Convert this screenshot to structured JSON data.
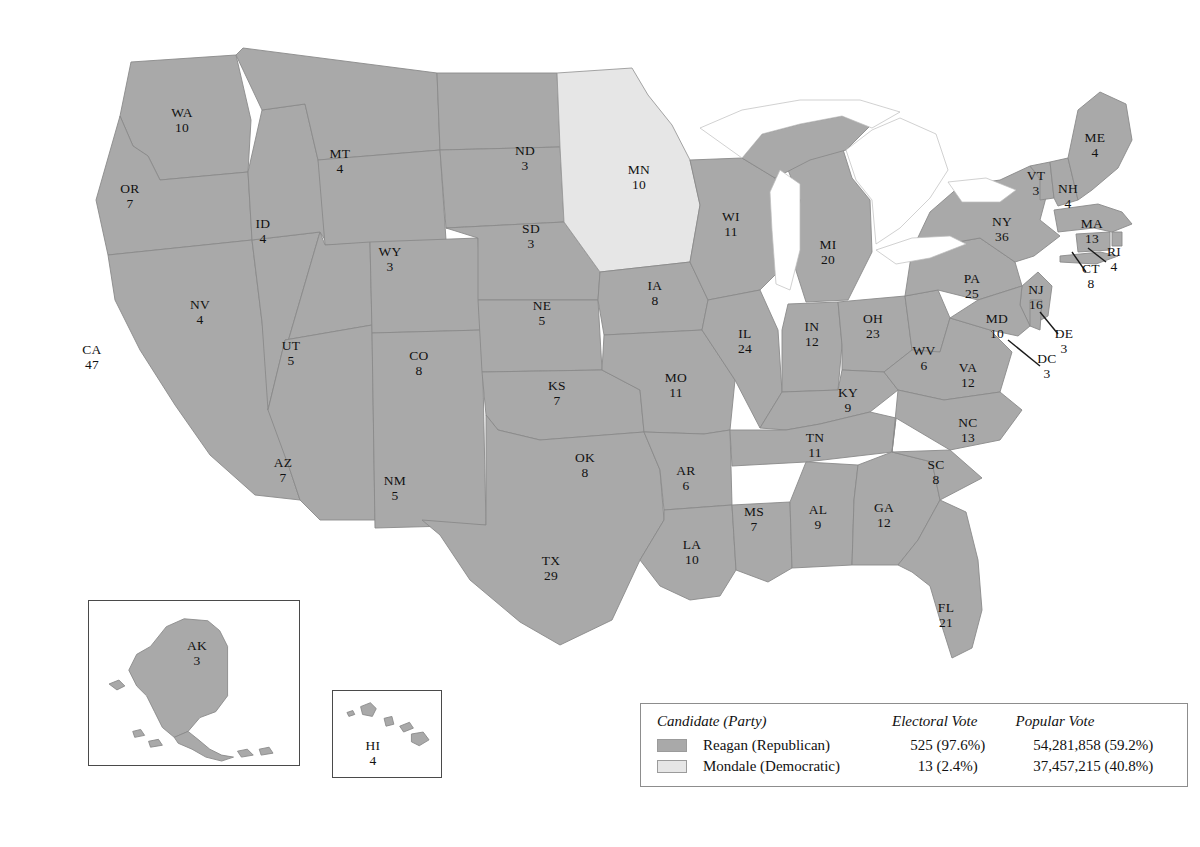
{
  "map": {
    "title": "1984 United States presidential election results by state",
    "colors": {
      "republican_fill": "#a9a9a9",
      "democratic_fill": "#e6e6e6",
      "state_border": "#8a8a8a",
      "label_text": "#111111",
      "inset_border": "#4a4a4a",
      "legend_border": "#8d8d8d"
    },
    "states": [
      {
        "code": "WA",
        "ev": "10",
        "party": "republican",
        "x": 182,
        "y": 120
      },
      {
        "code": "OR",
        "ev": "7",
        "party": "republican",
        "x": 130,
        "y": 196
      },
      {
        "code": "CA",
        "ev": "47",
        "party": "republican",
        "x": 92,
        "y": 357
      },
      {
        "code": "NV",
        "ev": "4",
        "party": "republican",
        "x": 200,
        "y": 312
      },
      {
        "code": "ID",
        "ev": "4",
        "party": "republican",
        "x": 263,
        "y": 231
      },
      {
        "code": "MT",
        "ev": "4",
        "party": "republican",
        "x": 340,
        "y": 161
      },
      {
        "code": "WY",
        "ev": "3",
        "party": "republican",
        "x": 390,
        "y": 259
      },
      {
        "code": "UT",
        "ev": "5",
        "party": "republican",
        "x": 291,
        "y": 353
      },
      {
        "code": "AZ",
        "ev": "7",
        "party": "republican",
        "x": 283,
        "y": 470
      },
      {
        "code": "CO",
        "ev": "8",
        "party": "republican",
        "x": 419,
        "y": 363
      },
      {
        "code": "NM",
        "ev": "5",
        "party": "republican",
        "x": 395,
        "y": 488
      },
      {
        "code": "ND",
        "ev": "3",
        "party": "republican",
        "x": 525,
        "y": 158
      },
      {
        "code": "SD",
        "ev": "3",
        "party": "republican",
        "x": 531,
        "y": 236
      },
      {
        "code": "NE",
        "ev": "5",
        "party": "republican",
        "x": 542,
        "y": 313
      },
      {
        "code": "KS",
        "ev": "7",
        "party": "republican",
        "x": 557,
        "y": 393
      },
      {
        "code": "OK",
        "ev": "8",
        "party": "republican",
        "x": 585,
        "y": 465
      },
      {
        "code": "TX",
        "ev": "29",
        "party": "republican",
        "x": 551,
        "y": 568
      },
      {
        "code": "MN",
        "ev": "10",
        "party": "democratic",
        "x": 639,
        "y": 177
      },
      {
        "code": "IA",
        "ev": "8",
        "party": "republican",
        "x": 655,
        "y": 293
      },
      {
        "code": "MO",
        "ev": "11",
        "party": "republican",
        "x": 676,
        "y": 385
      },
      {
        "code": "AR",
        "ev": "6",
        "party": "republican",
        "x": 686,
        "y": 478
      },
      {
        "code": "LA",
        "ev": "10",
        "party": "republican",
        "x": 692,
        "y": 552
      },
      {
        "code": "WI",
        "ev": "11",
        "party": "republican",
        "x": 731,
        "y": 224
      },
      {
        "code": "IL",
        "ev": "24",
        "party": "republican",
        "x": 745,
        "y": 341
      },
      {
        "code": "MS",
        "ev": "7",
        "party": "republican",
        "x": 754,
        "y": 519
      },
      {
        "code": "MI",
        "ev": "20",
        "party": "republican",
        "x": 828,
        "y": 252
      },
      {
        "code": "IN",
        "ev": "12",
        "party": "republican",
        "x": 812,
        "y": 334
      },
      {
        "code": "KY",
        "ev": "9",
        "party": "republican",
        "x": 848,
        "y": 400
      },
      {
        "code": "TN",
        "ev": "11",
        "party": "republican",
        "x": 815,
        "y": 445
      },
      {
        "code": "AL",
        "ev": "9",
        "party": "republican",
        "x": 818,
        "y": 517
      },
      {
        "code": "OH",
        "ev": "23",
        "party": "republican",
        "x": 873,
        "y": 326
      },
      {
        "code": "GA",
        "ev": "12",
        "party": "republican",
        "x": 884,
        "y": 515
      },
      {
        "code": "WV",
        "ev": "6",
        "party": "republican",
        "x": 924,
        "y": 358
      },
      {
        "code": "VA",
        "ev": "12",
        "party": "republican",
        "x": 968,
        "y": 375
      },
      {
        "code": "NC",
        "ev": "13",
        "party": "republican",
        "x": 968,
        "y": 430
      },
      {
        "code": "SC",
        "ev": "8",
        "party": "republican",
        "x": 936,
        "y": 472
      },
      {
        "code": "FL",
        "ev": "21",
        "party": "republican",
        "x": 946,
        "y": 615
      },
      {
        "code": "PA",
        "ev": "25",
        "party": "republican",
        "x": 972,
        "y": 286
      },
      {
        "code": "NY",
        "ev": "36",
        "party": "republican",
        "x": 1002,
        "y": 229
      },
      {
        "code": "NJ",
        "ev": "16",
        "party": "republican",
        "x": 1036,
        "y": 297
      },
      {
        "code": "MD",
        "ev": "10",
        "party": "republican",
        "x": 997,
        "y": 326
      },
      {
        "code": "DE",
        "ev": "3",
        "party": "republican",
        "x": 1064,
        "y": 341
      },
      {
        "code": "DC",
        "ev": "3",
        "party": "republican",
        "x": 1047,
        "y": 366
      },
      {
        "code": "VT",
        "ev": "3",
        "party": "republican",
        "x": 1036,
        "y": 183
      },
      {
        "code": "NH",
        "ev": "4",
        "party": "republican",
        "x": 1068,
        "y": 196
      },
      {
        "code": "ME",
        "ev": "4",
        "party": "republican",
        "x": 1095,
        "y": 145
      },
      {
        "code": "MA",
        "ev": "13",
        "party": "republican",
        "x": 1092,
        "y": 231
      },
      {
        "code": "RI",
        "ev": "4",
        "party": "republican",
        "x": 1114,
        "y": 259
      },
      {
        "code": "CT",
        "ev": "8",
        "party": "republican",
        "x": 1091,
        "y": 276
      },
      {
        "code": "AK",
        "ev": "3",
        "party": "republican",
        "x": 196,
        "y": 652
      },
      {
        "code": "HI",
        "ev": "4",
        "party": "republican",
        "x": 372,
        "y": 752
      }
    ]
  },
  "legend": {
    "headers": {
      "candidate": "Candidate (Party)",
      "electoral": "Electoral Vote",
      "popular": "Popular Vote"
    },
    "rows": [
      {
        "name": "Reagan (Republican)",
        "electoral": "525 (97.6%)",
        "popular": "54,281,858 (59.2%)",
        "swatch": "republican"
      },
      {
        "name": "Mondale (Democratic)",
        "electoral": "13 (2.4%)",
        "popular": "37,457,215 (40.8%)",
        "swatch": "democratic"
      }
    ]
  },
  "insets": {
    "alaska": {
      "label": "AK",
      "ev": "3"
    },
    "hawaii": {
      "label": "HI",
      "ev": "4"
    }
  }
}
